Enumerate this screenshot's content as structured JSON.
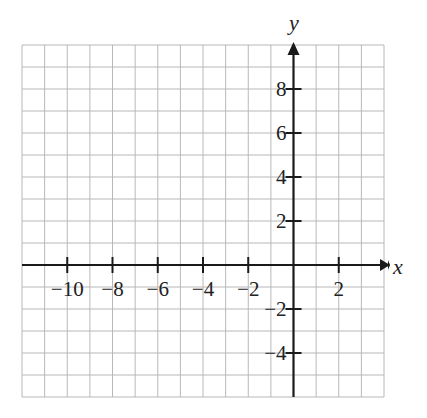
{
  "chart_data": {
    "type": "line",
    "title": "",
    "xlabel": "x",
    "ylabel": "y",
    "xlim": [
      -12,
      4
    ],
    "ylim": [
      -6,
      10
    ],
    "grid": true,
    "grid_step": 1,
    "x_ticks": [
      -10,
      -8,
      -6,
      -4,
      -2,
      2
    ],
    "x_tick_labels": [
      "−10",
      "−8",
      "−6",
      "−4",
      "−2",
      "2"
    ],
    "y_ticks": [
      8,
      6,
      4,
      2,
      -2,
      -4
    ],
    "y_tick_labels": [
      "8",
      "6",
      "4",
      "2",
      "−2",
      "−4"
    ],
    "series": []
  },
  "axes": {
    "x_label": "x",
    "y_label": "y"
  },
  "colors": {
    "grid": "#b8b8b8",
    "axis": "#1a1a1a",
    "background": "#ffffff"
  }
}
